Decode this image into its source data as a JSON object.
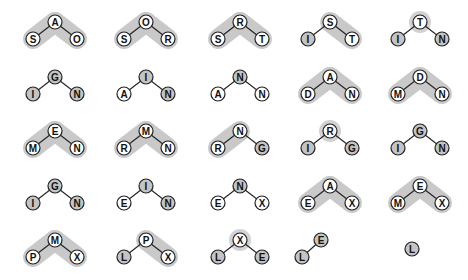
{
  "colors": {
    "background": "#ffffff",
    "highlight_band": "#c9c9c9",
    "node_white": "#ffffff",
    "node_grey": "#c4c4c4",
    "node_stroke": "#222222",
    "edge": "#222222",
    "halo": "#d2d2d2"
  },
  "layout": {
    "columns_x": [
      55,
      146,
      240,
      330,
      420
    ],
    "rows": [
      {
        "root_y": 22,
        "child_y": 39
      },
      {
        "root_y": 77,
        "child_y": 94
      },
      {
        "root_y": 131,
        "child_y": 148
      },
      {
        "root_y": 186,
        "child_y": 203
      },
      {
        "root_y": 240,
        "child_y": 257
      }
    ],
    "child_dx": 22,
    "node_r": 7
  },
  "trees": [
    {
      "row": 0,
      "col": 0,
      "root": {
        "label": "A",
        "fill": "white"
      },
      "left": {
        "label": "S",
        "fill": "white"
      },
      "right": {
        "label": "O",
        "fill": "white"
      },
      "band": "both"
    },
    {
      "row": 0,
      "col": 1,
      "root": {
        "label": "O",
        "fill": "white"
      },
      "left": {
        "label": "S",
        "fill": "white"
      },
      "right": {
        "label": "R",
        "fill": "white"
      },
      "band": "both"
    },
    {
      "row": 0,
      "col": 2,
      "root": {
        "label": "R",
        "fill": "white"
      },
      "left": {
        "label": "S",
        "fill": "white"
      },
      "right": {
        "label": "T",
        "fill": "white"
      },
      "band": "both"
    },
    {
      "row": 0,
      "col": 3,
      "root": {
        "label": "S",
        "fill": "white"
      },
      "left": {
        "label": "I",
        "fill": "grey"
      },
      "right": {
        "label": "T",
        "fill": "white"
      },
      "band": "right"
    },
    {
      "row": 0,
      "col": 4,
      "root": {
        "label": "T",
        "fill": "white"
      },
      "left": {
        "label": "I",
        "fill": "grey"
      },
      "right": {
        "label": "N",
        "fill": "grey"
      },
      "band": "halo"
    },
    {
      "row": 1,
      "col": 0,
      "root": {
        "label": "G",
        "fill": "grey"
      },
      "left": {
        "label": "I",
        "fill": "grey"
      },
      "right": {
        "label": "N",
        "fill": "grey"
      },
      "band": "none"
    },
    {
      "row": 1,
      "col": 1,
      "root": {
        "label": "I",
        "fill": "grey"
      },
      "left": {
        "label": "A",
        "fill": "white"
      },
      "right": {
        "label": "N",
        "fill": "grey"
      },
      "band": "none"
    },
    {
      "row": 1,
      "col": 2,
      "root": {
        "label": "N",
        "fill": "grey"
      },
      "left": {
        "label": "A",
        "fill": "white"
      },
      "right": {
        "label": "N",
        "fill": "white"
      },
      "band": "none"
    },
    {
      "row": 1,
      "col": 3,
      "root": {
        "label": "A",
        "fill": "white"
      },
      "left": {
        "label": "D",
        "fill": "white"
      },
      "right": {
        "label": "N",
        "fill": "white"
      },
      "band": "both"
    },
    {
      "row": 1,
      "col": 4,
      "root": {
        "label": "D",
        "fill": "white"
      },
      "left": {
        "label": "M",
        "fill": "white"
      },
      "right": {
        "label": "N",
        "fill": "white"
      },
      "band": "both"
    },
    {
      "row": 2,
      "col": 0,
      "root": {
        "label": "E",
        "fill": "white"
      },
      "left": {
        "label": "M",
        "fill": "white"
      },
      "right": {
        "label": "N",
        "fill": "white"
      },
      "band": "both"
    },
    {
      "row": 2,
      "col": 1,
      "root": {
        "label": "M",
        "fill": "white"
      },
      "left": {
        "label": "R",
        "fill": "white"
      },
      "right": {
        "label": "N",
        "fill": "white"
      },
      "band": "both"
    },
    {
      "row": 2,
      "col": 2,
      "root": {
        "label": "N",
        "fill": "white"
      },
      "left": {
        "label": "R",
        "fill": "white"
      },
      "right": {
        "label": "G",
        "fill": "grey"
      },
      "band": "left"
    },
    {
      "row": 2,
      "col": 3,
      "root": {
        "label": "R",
        "fill": "white"
      },
      "left": {
        "label": "I",
        "fill": "grey"
      },
      "right": {
        "label": "G",
        "fill": "grey"
      },
      "band": "halo"
    },
    {
      "row": 2,
      "col": 4,
      "root": {
        "label": "G",
        "fill": "grey"
      },
      "left": {
        "label": "I",
        "fill": "grey"
      },
      "right": {
        "label": "N",
        "fill": "grey"
      },
      "band": "none"
    },
    {
      "row": 3,
      "col": 0,
      "root": {
        "label": "G",
        "fill": "grey"
      },
      "left": {
        "label": "I",
        "fill": "grey"
      },
      "right": {
        "label": "N",
        "fill": "grey"
      },
      "band": "none"
    },
    {
      "row": 3,
      "col": 1,
      "root": {
        "label": "I",
        "fill": "grey"
      },
      "left": {
        "label": "E",
        "fill": "white"
      },
      "right": {
        "label": "N",
        "fill": "grey"
      },
      "band": "none"
    },
    {
      "row": 3,
      "col": 2,
      "root": {
        "label": "N",
        "fill": "grey"
      },
      "left": {
        "label": "E",
        "fill": "white"
      },
      "right": {
        "label": "X",
        "fill": "white"
      },
      "band": "none"
    },
    {
      "row": 3,
      "col": 3,
      "root": {
        "label": "A",
        "fill": "white"
      },
      "left": {
        "label": "E",
        "fill": "white"
      },
      "right": {
        "label": "X",
        "fill": "white"
      },
      "band": "both"
    },
    {
      "row": 3,
      "col": 4,
      "root": {
        "label": "E",
        "fill": "white"
      },
      "left": {
        "label": "M",
        "fill": "white"
      },
      "right": {
        "label": "X",
        "fill": "white"
      },
      "band": "both"
    },
    {
      "row": 4,
      "col": 0,
      "root": {
        "label": "M",
        "fill": "white"
      },
      "left": {
        "label": "P",
        "fill": "white"
      },
      "right": {
        "label": "X",
        "fill": "white"
      },
      "band": "both"
    },
    {
      "row": 4,
      "col": 1,
      "root": {
        "label": "P",
        "fill": "white"
      },
      "left": {
        "label": "L",
        "fill": "grey"
      },
      "right": {
        "label": "X",
        "fill": "white"
      },
      "band": "right"
    },
    {
      "row": 4,
      "col": 2,
      "root": {
        "label": "X",
        "fill": "white"
      },
      "left": {
        "label": "L",
        "fill": "grey"
      },
      "right": {
        "label": "E",
        "fill": "grey"
      },
      "band": "halo"
    },
    {
      "row": 4,
      "col": 3,
      "pair": true,
      "upper": {
        "label": "E",
        "fill": "grey",
        "x": 321,
        "y": 240
      },
      "lower": {
        "label": "L",
        "fill": "grey",
        "x": 302,
        "y": 257
      },
      "band": "none"
    },
    {
      "row": 4,
      "col": 4,
      "single": true,
      "node": {
        "label": "L",
        "fill": "grey",
        "x": 412,
        "y": 249
      },
      "band": "none"
    }
  ]
}
